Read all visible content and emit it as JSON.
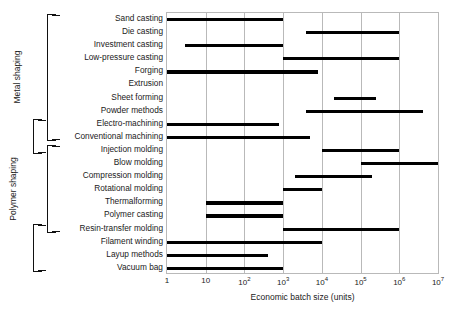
{
  "chart_data": {
    "type": "bar",
    "orientation": "horizontal-range",
    "title": "",
    "xlabel": "Economic batch size (units)",
    "ylabel": "",
    "xscale": "log",
    "xlim": [
      1,
      10000000
    ],
    "grid": "vertical",
    "legend": "none",
    "xticks": [
      {
        "value": 1,
        "label": "1",
        "mantissa": "1",
        "exponent": ""
      },
      {
        "value": 10,
        "label": "10",
        "mantissa": "10",
        "exponent": ""
      },
      {
        "value": 100,
        "label": "10^2",
        "mantissa": "10",
        "exponent": "2"
      },
      {
        "value": 1000,
        "label": "10^3",
        "mantissa": "10",
        "exponent": "3"
      },
      {
        "value": 10000,
        "label": "10^4",
        "mantissa": "10",
        "exponent": "4"
      },
      {
        "value": 100000,
        "label": "10^5",
        "mantissa": "10",
        "exponent": "5"
      },
      {
        "value": 1000000,
        "label": "10^6",
        "mantissa": "10",
        "exponent": "6"
      },
      {
        "value": 10000000,
        "label": "10^7",
        "mantissa": "10",
        "exponent": "7"
      }
    ],
    "categories": [
      "Sand casting",
      "Die casting",
      "Investment casting",
      "Low-pressure casting",
      "Forging",
      "Extrusion",
      "Sheet forming",
      "Powder methods",
      "Electro-machining",
      "Conventional machining",
      "Injection molding",
      "Blow molding",
      "Compression molding",
      "Rotational molding",
      "Thermalforming",
      "Polymer casting",
      "Resin-transfer molding",
      "Filament winding",
      "Layup methods",
      "Vacuum bag"
    ],
    "bars": [
      {
        "category": "Sand casting",
        "start": 1,
        "end": 1000
      },
      {
        "category": "Die casting",
        "start": 4000,
        "end": 1000000
      },
      {
        "category": "Investment casting",
        "start": 3,
        "end": 1000
      },
      {
        "category": "Low-pressure casting",
        "start": 1000,
        "end": 1000000
      },
      {
        "category": "Forging",
        "start": 1,
        "end": 8000
      },
      {
        "category": "Extrusion",
        "start": null,
        "end": null
      },
      {
        "category": "Sheet forming",
        "start": 20000,
        "end": 250000
      },
      {
        "category": "Powder methods",
        "start": 4000,
        "end": 4000000
      },
      {
        "category": "Electro-machining",
        "start": 1,
        "end": 800
      },
      {
        "category": "Conventional machining",
        "start": 1,
        "end": 5000
      },
      {
        "category": "Injection molding",
        "start": 10000,
        "end": 1000000
      },
      {
        "category": "Blow molding",
        "start": 100000,
        "end": 10000000
      },
      {
        "category": "Compression molding",
        "start": 2000,
        "end": 200000
      },
      {
        "category": "Rotational molding",
        "start": 1000,
        "end": 10000
      },
      {
        "category": "Thermalforming",
        "start": 10,
        "end": 1000
      },
      {
        "category": "Polymer casting",
        "start": 10,
        "end": 1000
      },
      {
        "category": "Resin-transfer molding",
        "start": 1000,
        "end": 1000000
      },
      {
        "category": "Filament winding",
        "start": 1,
        "end": 10000
      },
      {
        "category": "Layup methods",
        "start": 1,
        "end": 400
      },
      {
        "category": "Vacuum bag",
        "start": 1,
        "end": 1000
      }
    ],
    "groups": [
      {
        "label": "Metal shaping",
        "from": "Sand casting",
        "to": "Conventional machining"
      },
      {
        "label": "Ceramic shaping",
        "from": "Electro-machining",
        "to": "Injection molding"
      },
      {
        "label": "Polymer shaping",
        "from": "Injection molding",
        "to": "Resin-transfer molding"
      },
      {
        "label": "Composite shaping",
        "from": "Resin-transfer molding",
        "to": "Vacuum bag"
      }
    ]
  }
}
